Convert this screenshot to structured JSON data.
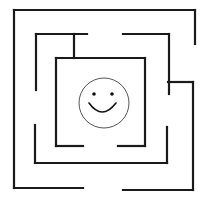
{
  "figure": {
    "type": "maze",
    "background": "#ffffff",
    "stroke_color": "#1a1a1a",
    "goal": "smiley-face",
    "walls": [
      {
        "name": "outer-top",
        "x1": 14,
        "y1": 10,
        "x2": 195,
        "y2": 10
      },
      {
        "name": "outer-right-upper",
        "x1": 195,
        "y1": 10,
        "x2": 195,
        "y2": 44
      },
      {
        "name": "outer-left",
        "x1": 14,
        "y1": 10,
        "x2": 14,
        "y2": 188
      },
      {
        "name": "outer-bottom-left",
        "x1": 14,
        "y1": 188,
        "x2": 83,
        "y2": 188
      },
      {
        "name": "outer-bottom-right",
        "x1": 123,
        "y1": 190,
        "x2": 193,
        "y2": 190
      },
      {
        "name": "outer-right-lower",
        "x1": 193,
        "y1": 82,
        "x2": 193,
        "y2": 190
      },
      {
        "name": "outer-right-connector",
        "x1": 168,
        "y1": 82,
        "x2": 193,
        "y2": 82
      },
      {
        "name": "ring2-top-left",
        "x1": 36,
        "y1": 34,
        "x2": 87,
        "y2": 34
      },
      {
        "name": "ring2-left-upper",
        "x1": 36,
        "y1": 34,
        "x2": 36,
        "y2": 90
      },
      {
        "name": "ring2-top-right",
        "x1": 123,
        "y1": 34,
        "x2": 169,
        "y2": 34
      },
      {
        "name": "ring2-right-upper",
        "x1": 169,
        "y1": 34,
        "x2": 169,
        "y2": 94
      },
      {
        "name": "ring2-left-lower",
        "x1": 35,
        "y1": 125,
        "x2": 35,
        "y2": 163
      },
      {
        "name": "ring2-bottom",
        "x1": 35,
        "y1": 163,
        "x2": 167,
        "y2": 163
      },
      {
        "name": "ring2-right-lower",
        "x1": 167,
        "y1": 127,
        "x2": 167,
        "y2": 163
      },
      {
        "name": "connector-top",
        "x1": 74,
        "y1": 34,
        "x2": 74,
        "y2": 58
      },
      {
        "name": "inner-top",
        "x1": 56,
        "y1": 58,
        "x2": 145,
        "y2": 58
      },
      {
        "name": "inner-right",
        "x1": 145,
        "y1": 58,
        "x2": 145,
        "y2": 146
      },
      {
        "name": "inner-left",
        "x1": 56,
        "y1": 58,
        "x2": 56,
        "y2": 146
      },
      {
        "name": "inner-bottom-left",
        "x1": 56,
        "y1": 146,
        "x2": 83,
        "y2": 146
      },
      {
        "name": "inner-bottom-right",
        "x1": 118,
        "y1": 146,
        "x2": 145,
        "y2": 146
      }
    ],
    "smiley": {
      "cx": 104,
      "cy": 103,
      "r": 25
    }
  }
}
